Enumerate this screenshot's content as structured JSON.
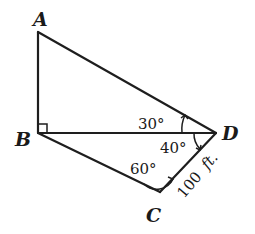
{
  "diagram": {
    "vertices": {
      "A": {
        "label": "A",
        "x": 38,
        "y": 32
      },
      "B": {
        "label": "B",
        "x": 38,
        "y": 133
      },
      "C": {
        "label": "C",
        "x": 160,
        "y": 192
      },
      "D": {
        "label": "D",
        "x": 216,
        "y": 133
      }
    },
    "segments": [
      "AB",
      "AD",
      "BD",
      "BC",
      "CD"
    ],
    "angles": {
      "ABD": {
        "label": "",
        "marker": "right-angle"
      },
      "ADB": {
        "label": "30°"
      },
      "BDC": {
        "label": "40°"
      },
      "BCD": {
        "label": "60°"
      }
    },
    "lengths": {
      "CD": {
        "value": "100",
        "unit": "ft."
      }
    }
  }
}
